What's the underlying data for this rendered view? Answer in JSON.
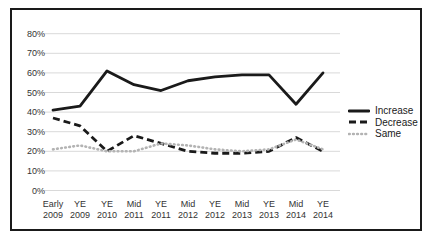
{
  "chart_data": {
    "type": "line",
    "title": "",
    "xlabel": "",
    "ylabel": "",
    "categories": [
      [
        "Early",
        "2009"
      ],
      [
        "YE",
        "2009"
      ],
      [
        "YE",
        "2010"
      ],
      [
        "Mid",
        "2011"
      ],
      [
        "YE",
        "2011"
      ],
      [
        "Mid",
        "2012"
      ],
      [
        "YE",
        "2012"
      ],
      [
        "Mid",
        "2013"
      ],
      [
        "YE",
        "2013"
      ],
      [
        "Mid",
        "2014"
      ],
      [
        "YE",
        "2014"
      ]
    ],
    "series": [
      {
        "name": "Increase",
        "style": "solid",
        "color": "#1a1a1a",
        "values": [
          41,
          43,
          61,
          54,
          51,
          56,
          58,
          59,
          59,
          44,
          60
        ]
      },
      {
        "name": "Decrease",
        "style": "dashed",
        "color": "#1a1a1a",
        "values": [
          37,
          33,
          20,
          28,
          24,
          20,
          19,
          19,
          20,
          27,
          20
        ]
      },
      {
        "name": "Same",
        "style": "dotted",
        "color": "#b3b3b3",
        "values": [
          21,
          23,
          20,
          20,
          24,
          23,
          21,
          20,
          21,
          26,
          21
        ]
      }
    ],
    "ylim": [
      0,
      80
    ],
    "ytick_step": 10,
    "ytick_labels": [
      "0%",
      "10%",
      "20%",
      "30%",
      "40%",
      "50%",
      "60%",
      "70%",
      "80%"
    ],
    "grid": true,
    "legend_position": "right",
    "colors": {
      "gridline": "#d9d9d9",
      "frame_border": "#1a1a1a",
      "background": "#ffffff",
      "tick_text": "#333333"
    }
  }
}
